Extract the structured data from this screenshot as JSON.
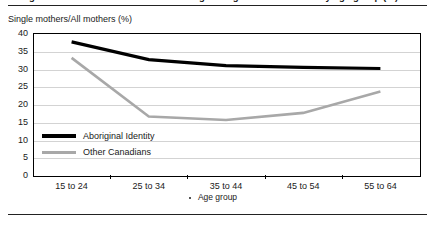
{
  "figure": {
    "cut_off_title": "Single mothers are more common among Aboriginal women in every age group (%)",
    "y_axis_title": "Single mothers/All mothers (%)",
    "x_axis_title": "Age group",
    "x_axis_title_marker": ""
  },
  "chart_data": {
    "type": "line",
    "title": "",
    "subtitle": "",
    "xlabel": "Age group",
    "ylabel": "Single mothers/All mothers (%)",
    "categories": [
      "15 to 24",
      "25 to 34",
      "35 to 44",
      "45 to 54",
      "55 to 64"
    ],
    "series": [
      {
        "name": "Aboriginal Identity",
        "color": "#000000",
        "line_width": 3.2,
        "values": [
          37.5,
          32.5,
          30.8,
          30.3,
          30.0
        ]
      },
      {
        "name": "Other Canadians",
        "color": "#a8a8a8",
        "line_width": 2.6,
        "values": [
          33.0,
          16.5,
          15.5,
          17.5,
          23.5
        ]
      }
    ],
    "ylim": [
      0,
      40
    ],
    "yticks": [
      0,
      5,
      10,
      15,
      20,
      25,
      30,
      35,
      40
    ],
    "ytick_labels": [
      "0",
      "5",
      "10",
      "15",
      "20",
      "25",
      "30",
      "35",
      "40"
    ],
    "grid": true,
    "grid_axis": "y",
    "grid_color": "#d3d3d3",
    "legend_position": "inside-lower-left",
    "plot_border_color": "#000000",
    "background": "#ffffff"
  },
  "legend": {
    "entries": [
      {
        "label": "Aboriginal Identity",
        "style": "thick",
        "color": "#000000"
      },
      {
        "label": "Other Canadians",
        "style": "thin",
        "color": "#a8a8a8"
      }
    ]
  },
  "rules": {
    "top_rule_color": "#222222",
    "bottom_rule_color": "#222222"
  }
}
